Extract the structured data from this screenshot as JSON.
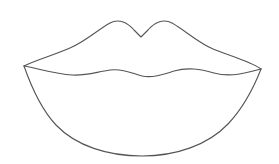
{
  "document": {
    "title": "Lips Outline",
    "subject": "lips",
    "style": "line-art-outline",
    "background_color": "#ffffff",
    "stroke_color": "#555555",
    "stroke_width": 1.1,
    "canvas": {
      "width": 279,
      "height": 164
    },
    "fill": "none",
    "text_labels": []
  },
  "drawing": {
    "name": "lips-outline",
    "description": "Black-and-white outline drawing of a pair of lips, upper lip with cupid's bow and fuller lower lip",
    "anchor_points": {
      "left_corner": {
        "x": 24,
        "y": 66
      },
      "right_corner": {
        "x": 261,
        "y": 69
      },
      "left_peak": {
        "x": 110,
        "y": 22
      },
      "right_peak": {
        "x": 172,
        "y": 22
      },
      "cupids_bow_notch": {
        "x": 141,
        "y": 37
      },
      "lower_lip_bottom": {
        "x": 142,
        "y": 156
      }
    },
    "paths": {
      "upper_lip_outer": "M24,66 C36,60 54,55 70,48 C86,41 96,31 110,23 C119,18 128,23 134,30 L141,37 L148,30 C154,23 163,18 172,23 C186,31 197,42 213,49 C230,56 250,61 261,69",
      "mouth_line": "M24,66 C40,69 56,74 72,75 C86,76 96,72 110,70 C124,68 133,74 142,76 C152,78 162,75 174,71 C188,67 200,69 214,73 C232,78 250,72 261,69",
      "lower_lip_outer": "M24,66 C31,86 40,108 56,125 C76,146 108,156 142,156 C176,156 208,145 228,124 C244,107 254,87 261,69"
    }
  }
}
